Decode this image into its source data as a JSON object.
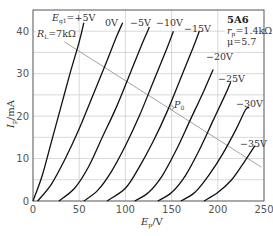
{
  "chart_data": {
    "type": "line",
    "title": "5A6",
    "xlabel": "E_p/V",
    "ylabel": "I_p/mA",
    "xlim": [
      0,
      250
    ],
    "ylim": [
      0,
      45
    ],
    "x_ticks": [
      0,
      50,
      100,
      150,
      200,
      250
    ],
    "y_ticks": [
      0,
      10,
      20,
      30,
      40
    ],
    "grid": true,
    "annotations": {
      "tube": "5A6",
      "rp": "r_p=1.4kΩ",
      "mu": "μ=5.7",
      "load_line": "R_L=7kΩ",
      "operating_point": "P_0"
    },
    "load_line": {
      "x": [
        34,
        247
      ],
      "y": [
        37.5,
        8
      ]
    },
    "operating_point": {
      "x": 150,
      "y": 22
    },
    "series": [
      {
        "name": "E_g1=+5V",
        "label": "E_g1=+5V",
        "points": [
          [
            0,
            0
          ],
          [
            10,
            6
          ],
          [
            20,
            14
          ],
          [
            30,
            22
          ],
          [
            40,
            30
          ],
          [
            50,
            37.5
          ],
          [
            55,
            42
          ]
        ]
      },
      {
        "name": "0V",
        "label": "0V",
        "points": [
          [
            5,
            0
          ],
          [
            20,
            4
          ],
          [
            35,
            10
          ],
          [
            50,
            17
          ],
          [
            65,
            25
          ],
          [
            80,
            33
          ],
          [
            90,
            38.5
          ],
          [
            97,
            42
          ]
        ]
      },
      {
        "name": "-5V",
        "label": "−5V",
        "points": [
          [
            28,
            0
          ],
          [
            45,
            3
          ],
          [
            60,
            8
          ],
          [
            75,
            15
          ],
          [
            90,
            22
          ],
          [
            105,
            30
          ],
          [
            118,
            37
          ],
          [
            126,
            41
          ]
        ]
      },
      {
        "name": "-10V",
        "label": "−10V",
        "points": [
          [
            55,
            0
          ],
          [
            70,
            2.5
          ],
          [
            85,
            7
          ],
          [
            100,
            13
          ],
          [
            115,
            20
          ],
          [
            130,
            28
          ],
          [
            145,
            36
          ],
          [
            152,
            40
          ]
        ]
      },
      {
        "name": "-15V",
        "label": "−15V",
        "points": [
          [
            80,
            0
          ],
          [
            100,
            3
          ],
          [
            115,
            8
          ],
          [
            130,
            14
          ],
          [
            145,
            21
          ],
          [
            160,
            29
          ],
          [
            173,
            36
          ],
          [
            180,
            40
          ]
        ]
      },
      {
        "name": "-20V",
        "label": "−20V",
        "points": [
          [
            110,
            0
          ],
          [
            125,
            2
          ],
          [
            140,
            6
          ],
          [
            155,
            12
          ],
          [
            170,
            19
          ],
          [
            185,
            26
          ],
          [
            195,
            31
          ]
        ]
      },
      {
        "name": "-25V",
        "label": "−25V",
        "points": [
          [
            135,
            0
          ],
          [
            150,
            2
          ],
          [
            165,
            6
          ],
          [
            180,
            12
          ],
          [
            195,
            19
          ],
          [
            208,
            25
          ],
          [
            214,
            28
          ]
        ]
      },
      {
        "name": "-30V",
        "label": "−30V",
        "points": [
          [
            160,
            0
          ],
          [
            175,
            2
          ],
          [
            190,
            6
          ],
          [
            205,
            11
          ],
          [
            220,
            17
          ],
          [
            230,
            21.5
          ],
          [
            234,
            22
          ]
        ]
      },
      {
        "name": "-35V",
        "label": "−35V",
        "points": [
          [
            185,
            0
          ],
          [
            200,
            2
          ],
          [
            215,
            5
          ],
          [
            228,
            9
          ],
          [
            240,
            13
          ]
        ]
      }
    ]
  }
}
